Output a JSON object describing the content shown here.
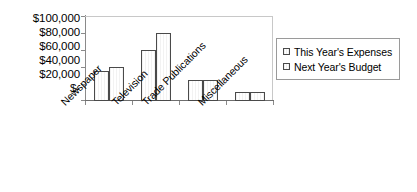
{
  "chart_data": {
    "type": "bar",
    "title": "",
    "subtitle": "",
    "xlabel": "",
    "ylabel": "",
    "categories": [
      "Newspaper",
      "Television",
      "Trade Publications",
      "Miscellaneous"
    ],
    "series": [
      {
        "name": "This Year's Expenses",
        "values": [
          35000,
          60000,
          25000,
          10000
        ]
      },
      {
        "name": "Next Year's Budget",
        "values": [
          40000,
          80000,
          25000,
          10000
        ]
      }
    ],
    "ylim": [
      0,
      100000
    ],
    "ytick_values": [
      0,
      20000,
      40000,
      60000,
      80000,
      100000
    ],
    "ytick_labels": [
      "$-",
      "$20,000",
      "$40,000",
      "$60,000",
      "$80,000",
      "$100,000"
    ],
    "grid": false,
    "legend_position": "right",
    "legend_entries": [
      "This Year's Expenses",
      "Next Year's Budget"
    ],
    "category_label_rotation": -45,
    "colors": {
      "bar_fill": "#fdfdfd",
      "bar_border": "#4a4a4a",
      "axis_line": "#8a8a8a",
      "plot_border": "#c8c8c8",
      "legend_border": "#9a9a9a",
      "text": "#000000",
      "background": "#ffffff"
    }
  }
}
